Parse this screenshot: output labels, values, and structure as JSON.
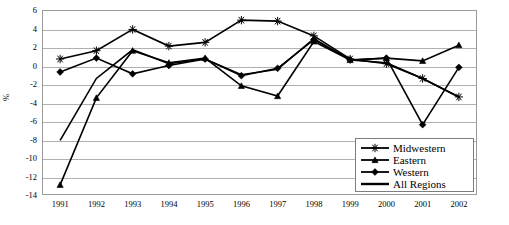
{
  "chart_data": {
    "type": "line",
    "title": "",
    "xlabel": "",
    "ylabel": "%",
    "categories": [
      "1991",
      "1992",
      "1993",
      "1994",
      "1995",
      "1996",
      "1997",
      "1998",
      "1999",
      "2000",
      "2001",
      "2002"
    ],
    "x": [
      1991,
      1992,
      1993,
      1994,
      1995,
      1996,
      1997,
      1998,
      1999,
      2000,
      2001,
      2002
    ],
    "ylim": [
      -14,
      6
    ],
    "yticks": [
      6,
      4,
      2,
      0,
      -2,
      -4,
      -6,
      -8,
      -10,
      -12,
      -14
    ],
    "ytick_labels": [
      "6",
      "4",
      "2",
      "0",
      "-2",
      "-4",
      "-6",
      "-8",
      "-10",
      "-12",
      "-14"
    ],
    "grid": "horizontal",
    "legend_position": "bottom-right",
    "series": [
      {
        "name": "Midwestern",
        "marker": "star-asterisk",
        "values": [
          0.7,
          1.6,
          3.9,
          2.1,
          2.5,
          4.9,
          4.8,
          3.2,
          0.7,
          0.2,
          -1.4,
          -3.4
        ]
      },
      {
        "name": "Eastern",
        "marker": "triangle",
        "values": [
          -12.9,
          -3.5,
          1.6,
          0.3,
          0.8,
          -2.2,
          -3.3,
          2.6,
          0.6,
          0.8,
          0.5,
          2.2
        ]
      },
      {
        "name": "Western",
        "marker": "diamond",
        "values": [
          -0.7,
          0.8,
          -0.9,
          0.0,
          0.7,
          -1.1,
          -0.3,
          2.8,
          0.6,
          0.8,
          -6.4,
          -0.2
        ]
      },
      {
        "name": "All Regions",
        "marker": "none",
        "values": [
          -8.1,
          -1.4,
          1.7,
          0.2,
          0.7,
          -1.0,
          -0.4,
          2.9,
          0.6,
          0.3,
          -1.4,
          -3.4
        ]
      }
    ]
  },
  "legend": {
    "items": [
      {
        "label": "Midwestern"
      },
      {
        "label": "Eastern"
      },
      {
        "label": "Western"
      },
      {
        "label": "All Regions"
      }
    ]
  }
}
